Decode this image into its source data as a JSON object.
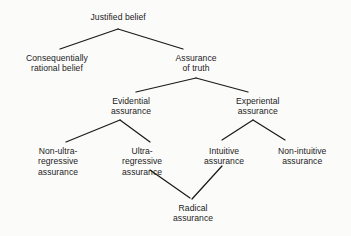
{
  "diagram": {
    "type": "tree-diagram",
    "background_color": "#fbfbfa",
    "line_color": "#1a1a1a",
    "text_color": "#1c1c1c",
    "nodes": [
      {
        "id": "justified-belief",
        "level": 0,
        "lines": [
          "Justified belief"
        ],
        "x": 118,
        "y": 12
      },
      {
        "id": "consequentially-rational-belief",
        "level": 1,
        "lines": [
          "Consequentially",
          "rational belief"
        ],
        "x": 57,
        "y": 53
      },
      {
        "id": "assurance-of-truth",
        "level": 1,
        "lines": [
          "Assurance",
          "of truth"
        ],
        "x": 196,
        "y": 53
      },
      {
        "id": "evidential-assurance",
        "level": 2,
        "lines": [
          "Evidential",
          "assurance"
        ],
        "x": 131,
        "y": 96
      },
      {
        "id": "experiental-assurance",
        "level": 2,
        "lines": [
          "Experiental",
          "assurance"
        ],
        "x": 258,
        "y": 96
      },
      {
        "id": "non-ultra-regressive-assurance",
        "level": 3,
        "lines": [
          "Non-ultra-",
          "regressive",
          "assurance"
        ],
        "x": 58,
        "y": 146
      },
      {
        "id": "ultra-regressive-assurance",
        "level": 3,
        "lines": [
          "Ultra-",
          "regressive",
          "assurance"
        ],
        "x": 142,
        "y": 146
      },
      {
        "id": "intuitive-assurance",
        "level": 3,
        "lines": [
          "Intuitive",
          "assurance"
        ],
        "x": 224,
        "y": 146
      },
      {
        "id": "non-intuitive-assurance",
        "level": 3,
        "lines": [
          "Non-intuitive",
          "assurance"
        ],
        "x": 302,
        "y": 146
      },
      {
        "id": "radical-assurance",
        "level": 4,
        "lines": [
          "Radical",
          "assurance"
        ],
        "x": 193,
        "y": 203
      }
    ],
    "edges": [
      {
        "id": "edge-justified-to-consequentially",
        "from": "justified-belief",
        "to": "consequentially-rational-belief",
        "x1": 118,
        "y1": 29,
        "x2": 60,
        "y2": 49
      },
      {
        "id": "edge-justified-to-assurance",
        "from": "justified-belief",
        "to": "assurance-of-truth",
        "x1": 118,
        "y1": 29,
        "x2": 183,
        "y2": 49
      },
      {
        "id": "edge-assurance-to-evidential",
        "from": "assurance-of-truth",
        "to": "evidential-assurance",
        "x1": 196,
        "y1": 78,
        "x2": 136,
        "y2": 92
      },
      {
        "id": "edge-assurance-to-experiental",
        "from": "assurance-of-truth",
        "to": "experiental-assurance",
        "x1": 196,
        "y1": 78,
        "x2": 248,
        "y2": 92
      },
      {
        "id": "edge-evidential-to-non-ultra",
        "from": "evidential-assurance",
        "to": "non-ultra-regressive-assurance",
        "x1": 120,
        "y1": 120,
        "x2": 66,
        "y2": 142
      },
      {
        "id": "edge-evidential-to-ultra",
        "from": "evidential-assurance",
        "to": "ultra-regressive-assurance",
        "x1": 120,
        "y1": 120,
        "x2": 150,
        "y2": 142
      },
      {
        "id": "edge-experiental-to-intuitive",
        "from": "experiental-assurance",
        "to": "intuitive-assurance",
        "x1": 253,
        "y1": 120,
        "x2": 222,
        "y2": 140
      },
      {
        "id": "edge-experiental-to-non-intuitive",
        "from": "experiental-assurance",
        "to": "non-intuitive-assurance",
        "x1": 253,
        "y1": 120,
        "x2": 285,
        "y2": 140
      },
      {
        "id": "edge-ultra-to-radical",
        "from": "ultra-regressive-assurance",
        "to": "radical-assurance",
        "x1": 150,
        "y1": 170,
        "x2": 190,
        "y2": 198
      },
      {
        "id": "edge-intuitive-to-radical",
        "from": "intuitive-assurance",
        "to": "radical-assurance",
        "x1": 222,
        "y1": 166,
        "x2": 192,
        "y2": 199
      }
    ]
  }
}
